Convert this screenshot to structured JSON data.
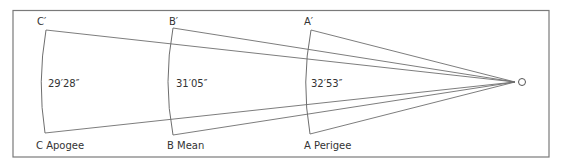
{
  "figure": {
    "observer_label": "O",
    "positions": [
      {
        "id": "C",
        "top_label": "C′",
        "bottom_label": "C Apogee",
        "angle": "29′28″"
      },
      {
        "id": "B",
        "top_label": "B′",
        "bottom_label": "B Mean",
        "angle": "31′05″"
      },
      {
        "id": "A",
        "top_label": "A′",
        "bottom_label": "A Perigee",
        "angle": "32′53″"
      }
    ]
  },
  "colors": {
    "line": "#6e6e6e",
    "frame": "#7a7a7a",
    "text": "#333333",
    "background": "#ffffff"
  }
}
